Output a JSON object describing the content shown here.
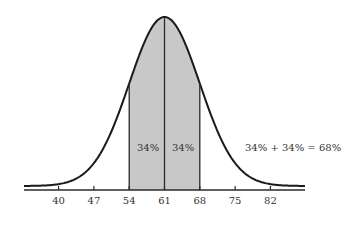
{
  "chart_data": {
    "type": "area",
    "title": "",
    "xlabel": "",
    "ylabel": "",
    "distribution": "normal",
    "mean": 61,
    "sd": 7,
    "x_ticks": [
      40,
      47,
      54,
      61,
      68,
      75,
      82
    ],
    "xlim": [
      33,
      89
    ],
    "shaded_region": {
      "from": 54,
      "to": 68,
      "color": "#c8c8c8"
    },
    "divider_at": 61,
    "grid": false,
    "legend": null,
    "annotations": [
      {
        "text": "34%",
        "region": "54-61"
      },
      {
        "text": "34%",
        "region": "61-68"
      },
      {
        "text": "34% + 34% = 68%",
        "position": "right"
      }
    ]
  },
  "labels": {
    "left_region": "34%",
    "right_region": "34%",
    "summary": "34% + 34% = 68%",
    "ticks": [
      "40",
      "47",
      "54",
      "61",
      "68",
      "75",
      "82"
    ]
  },
  "colors": {
    "curve": "#1a1a1a",
    "shade": "#c8c8c8",
    "axis": "#2a2a2a",
    "text": "#333333"
  }
}
